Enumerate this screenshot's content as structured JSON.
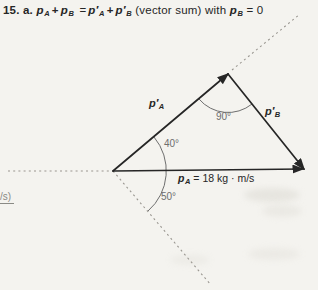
{
  "colors": {
    "paper": "#f4f3ef",
    "ink": "#262626",
    "dashed": "#999690",
    "arc": "#6e6e6e",
    "muted": "#8a8a85"
  },
  "equation": {
    "prefix": "15. a.",
    "t0": {
      "base": "p",
      "sub": "A"
    },
    "op1": "+",
    "t1": {
      "base": "p",
      "sub": "B"
    },
    "eq": "=",
    "t2": {
      "base": "p′",
      "sub": "A"
    },
    "op2": "+",
    "t3": {
      "base": "p′",
      "sub": "B"
    },
    "note": "(vector sum) with",
    "t4": {
      "base": "p",
      "sub": "B"
    },
    "rhs": "= 0"
  },
  "diagram": {
    "label_pA_prime": {
      "base": "p′",
      "sub": "A"
    },
    "label_pB_prime": {
      "base": "p′",
      "sub": "B"
    },
    "label_pA": {
      "base": "p",
      "sub": "A",
      "value": "= 18 kg · m/s"
    },
    "angle_apex": "90°",
    "angle_upper": "40°",
    "angle_lower": "50°"
  },
  "margin_note": {
    "text": "/s)"
  }
}
